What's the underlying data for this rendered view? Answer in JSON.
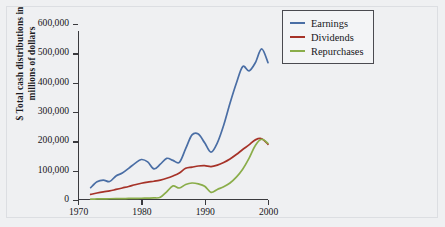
{
  "chart_data": {
    "type": "line",
    "title": "",
    "xlabel": "",
    "ylabel": "$ Total cash distributions in millions of dollars",
    "ylabel_line1": "$ Total cash distributions in",
    "ylabel_line2": "millions of dollars",
    "xlim": [
      1970,
      2000
    ],
    "ylim": [
      0,
      600000
    ],
    "grid": false,
    "legend_position": "top-right",
    "xticks": [
      1970,
      1980,
      1990,
      2000
    ],
    "xtick_labels": [
      "1970",
      "1980",
      "1990",
      "2000"
    ],
    "yticks": [
      0,
      100000,
      200000,
      300000,
      400000,
      500000,
      600000
    ],
    "ytick_labels": [
      "0",
      "100,000",
      "200,000",
      "300,000",
      "400,000",
      "500,000",
      "600,000"
    ],
    "series": [
      {
        "name": "Earnings",
        "color": "#4a6ea5",
        "x": [
          1972,
          1973,
          1974,
          1975,
          1976,
          1977,
          1978,
          1979,
          1980,
          1981,
          1982,
          1983,
          1984,
          1985,
          1986,
          1987,
          1988,
          1989,
          1990,
          1991,
          1992,
          1993,
          1994,
          1995,
          1996,
          1997,
          1998,
          1999,
          2000
        ],
        "values": [
          42000,
          62000,
          68000,
          63000,
          82000,
          92000,
          108000,
          125000,
          138000,
          130000,
          106000,
          122000,
          142000,
          135000,
          128000,
          175000,
          222000,
          225000,
          195000,
          163000,
          195000,
          255000,
          330000,
          398000,
          455000,
          440000,
          468000,
          515000,
          468000
        ]
      },
      {
        "name": "Dividends",
        "color": "#a63228",
        "x": [
          1972,
          1973,
          1974,
          1975,
          1976,
          1977,
          1978,
          1979,
          1980,
          1981,
          1982,
          1983,
          1984,
          1985,
          1986,
          1987,
          1988,
          1989,
          1990,
          1991,
          1992,
          1993,
          1994,
          1995,
          1996,
          1997,
          1998,
          1999,
          2000
        ],
        "values": [
          19000,
          24000,
          28000,
          31000,
          36000,
          41000,
          46000,
          52000,
          57000,
          61000,
          64000,
          68000,
          74000,
          82000,
          92000,
          108000,
          112000,
          116000,
          117000,
          114000,
          119000,
          128000,
          140000,
          155000,
          172000,
          188000,
          205000,
          209000,
          190000
        ]
      },
      {
        "name": "Repurchases",
        "color": "#8aad4a",
        "x": [
          1972,
          1973,
          1974,
          1975,
          1976,
          1977,
          1978,
          1979,
          1980,
          1981,
          1982,
          1983,
          1984,
          1985,
          1986,
          1987,
          1988,
          1989,
          1990,
          1991,
          1992,
          1993,
          1994,
          1995,
          1996,
          1997,
          1998,
          1999,
          2000
        ],
        "values": [
          3000,
          3500,
          4000,
          4200,
          4500,
          4800,
          5200,
          5600,
          6000,
          6500,
          7000,
          9000,
          28000,
          48000,
          41000,
          53000,
          58000,
          55000,
          47000,
          26000,
          36000,
          45000,
          58000,
          78000,
          105000,
          142000,
          186000,
          207000,
          193000
        ]
      }
    ]
  },
  "legend": {
    "items": [
      {
        "label": "Earnings",
        "color": "#4a6ea5"
      },
      {
        "label": "Dividends",
        "color": "#a63228"
      },
      {
        "label": "Repurchases",
        "color": "#8aad4a"
      }
    ]
  }
}
